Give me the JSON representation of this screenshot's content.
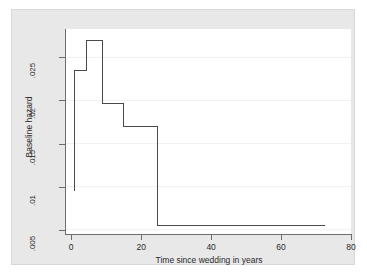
{
  "chart_data": {
    "type": "line",
    "title": "",
    "subtitle": "",
    "xlabel": "Time since wedding in years",
    "ylabel": "Baseline hazard",
    "xlim": [
      -1.5,
      80
    ],
    "ylim": [
      0.0045,
      0.0283
    ],
    "xticks": [
      0,
      20,
      40,
      60,
      80
    ],
    "xtick_labels": [
      "0",
      "20",
      "40",
      "60",
      "80"
    ],
    "yticks": [
      0.005,
      0.01,
      0.015,
      0.02,
      0.025
    ],
    "ytick_labels": [
      ".005",
      ".01",
      ".015",
      ".02",
      ".025"
    ],
    "grid": "horizontal",
    "grid_color": "#f0f0f0",
    "legend": "none",
    "series": [
      {
        "name": "Baseline hazard",
        "style": "step-post",
        "color": "#4a4a4a",
        "line_width": 1,
        "points": [
          {
            "x": 1.0,
            "y": 0.0095
          },
          {
            "x": 1.0,
            "y": 0.0235
          },
          {
            "x": 4.3,
            "y": 0.0235
          },
          {
            "x": 4.3,
            "y": 0.027
          },
          {
            "x": 9.0,
            "y": 0.027
          },
          {
            "x": 9.0,
            "y": 0.0196
          },
          {
            "x": 14.8,
            "y": 0.0196
          },
          {
            "x": 14.8,
            "y": 0.017
          },
          {
            "x": 24.8,
            "y": 0.017
          },
          {
            "x": 24.8,
            "y": 0.0055
          },
          {
            "x": 72.5,
            "y": 0.0055
          }
        ]
      }
    ]
  },
  "figure": {
    "background": "#ffffff",
    "graph_region_color": "#e8e8e8",
    "plot_region_color": "#ffffff",
    "axis_color": "#6d6d6d"
  }
}
